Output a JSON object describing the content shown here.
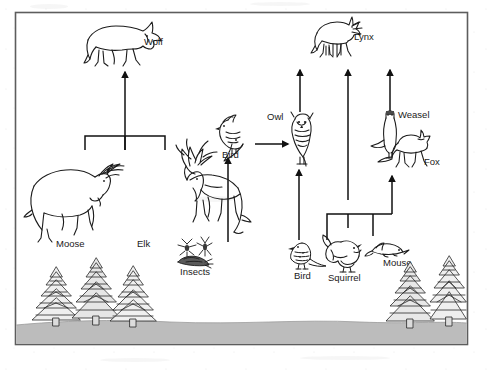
{
  "figure": {
    "kind": "food-web-diagram",
    "title": "",
    "caption": "",
    "frame": {
      "border_color": "#555555",
      "background_color": "#ffffff"
    },
    "ground": {
      "label": "ground-band",
      "color": "#b8b8b8"
    },
    "line_color": "#111111"
  },
  "organisms": [
    {
      "id": "wolf",
      "label": "Wolf",
      "icon": "wolf-icon",
      "trophic": "predator"
    },
    {
      "id": "lynx",
      "label": "Lynx",
      "icon": "lynx-icon",
      "trophic": "predator"
    },
    {
      "id": "owl",
      "label": "Owl",
      "icon": "owl-icon",
      "trophic": "predator"
    },
    {
      "id": "weasel",
      "label": "Weasel",
      "icon": "weasel-icon",
      "trophic": "predator"
    },
    {
      "id": "fox",
      "label": "Fox",
      "icon": "fox-icon",
      "trophic": "predator"
    },
    {
      "id": "bird_top",
      "label": "Bird",
      "icon": "bird-icon",
      "trophic": "consumer"
    },
    {
      "id": "moose",
      "label": "Moose",
      "icon": "moose-icon",
      "trophic": "herbivore"
    },
    {
      "id": "elk",
      "label": "Elk",
      "icon": "elk-icon",
      "trophic": "herbivore"
    },
    {
      "id": "insects",
      "label": "Insects",
      "icon": "insects-icon",
      "trophic": "consumer"
    },
    {
      "id": "bird_low",
      "label": "Bird",
      "icon": "bird-icon",
      "trophic": "consumer"
    },
    {
      "id": "squirrel",
      "label": "Squirrel",
      "icon": "squirrel-icon",
      "trophic": "herbivore"
    },
    {
      "id": "mouse",
      "label": "Mouse",
      "icon": "mouse-icon",
      "trophic": "herbivore"
    },
    {
      "id": "trees_left",
      "label": "",
      "icon": "conifer-trees-icon",
      "trophic": "producer"
    },
    {
      "id": "trees_right",
      "label": "",
      "icon": "conifer-trees-icon",
      "trophic": "producer"
    }
  ],
  "labels": {
    "wolf": "Wolf",
    "lynx": "Lynx",
    "owl": "Owl",
    "weasel": "Weasel",
    "fox": "Fox",
    "bird_top": "Bird",
    "moose": "Moose",
    "elk": "Elk",
    "insects": "Insects",
    "bird_low": "Bird",
    "squirrel": "Squirrel",
    "mouse": "Mouse"
  },
  "flows": [
    {
      "id": "moose-to-wolf",
      "from": "moose",
      "to": "wolf",
      "style": "bracket-up"
    },
    {
      "id": "elk-to-wolf",
      "from": "elk",
      "to": "wolf",
      "style": "bracket-up"
    },
    {
      "id": "insects-to-bird",
      "from": "insects",
      "to": "bird_top",
      "style": "arrow-up"
    },
    {
      "id": "bird-to-owl",
      "from": "bird_top",
      "to": "owl",
      "style": "arrow-right"
    },
    {
      "id": "birdlow-to-owl",
      "from": "bird_low",
      "to": "owl",
      "style": "arrow-up"
    },
    {
      "id": "owl-to-lynx",
      "from": "owl",
      "to": "lynx",
      "style": "arrow-up"
    },
    {
      "id": "squirrel-to-lynx",
      "from": "squirrel",
      "to": "lynx",
      "style": "bracket-arrow-up"
    },
    {
      "id": "mouse-to-fox",
      "from": "mouse",
      "to": "fox",
      "style": "bracket-arrow-up"
    },
    {
      "id": "fox-to-lynx",
      "from": "fox",
      "to": "lynx",
      "style": "arrow-up"
    },
    {
      "id": "weasel-to-lynx",
      "from": "weasel",
      "to": "lynx",
      "style": "arrow-up"
    }
  ]
}
